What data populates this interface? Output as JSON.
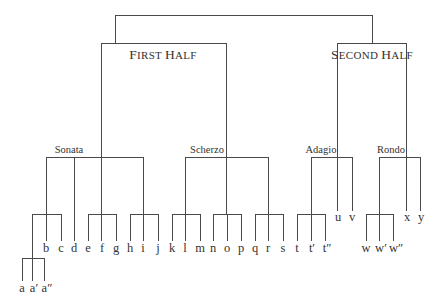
{
  "diagram": {
    "type": "tree",
    "root": {
      "children": [
        {
          "label": "First Half",
          "label_small_caps": true,
          "children": [
            {
              "label": "Sonata",
              "children": [
                {
                  "group": [
                    "a",
                    "a′",
                    "a″"
                  ],
                  "siblings": [
                    "b",
                    "c"
                  ]
                },
                "d",
                {
                  "group": [
                    "e",
                    "f",
                    "g"
                  ]
                },
                {
                  "group": [
                    "h",
                    "i",
                    "j"
                  ]
                }
              ]
            },
            {
              "label": "Scherzo",
              "children": [
                {
                  "group": [
                    "k",
                    "l",
                    "m"
                  ]
                },
                {
                  "group": [
                    "n",
                    "o",
                    "p"
                  ]
                },
                {
                  "group": [
                    "q",
                    "r",
                    "s"
                  ]
                }
              ]
            }
          ]
        },
        {
          "label": "Second Half",
          "label_small_caps": true,
          "children": [
            {
              "label": "Adagio",
              "children": [
                {
                  "group": [
                    "t",
                    "t′",
                    "t″"
                  ]
                },
                "u",
                "v"
              ]
            },
            {
              "label": "Rondo",
              "children": [
                {
                  "group": [
                    "w",
                    "w′",
                    "w″"
                  ]
                },
                "x",
                "y"
              ]
            }
          ]
        }
      ]
    }
  },
  "labels": {
    "first_half_big": "F",
    "first_half_rest": "IRST ",
    "first_half_big2": "H",
    "first_half_rest2": "ALF",
    "second_half_big": "S",
    "second_half_rest": "ECOND ",
    "second_half_big2": "H",
    "second_half_rest2": "ALF",
    "sonata": "Sonata",
    "scherzo": "Scherzo",
    "adagio": "Adagio",
    "rondo": "Rondo"
  },
  "leaves": {
    "a": "a",
    "a1": "a′",
    "a2": "a″",
    "b": "b",
    "c": "c",
    "d": "d",
    "e": "e",
    "f": "f",
    "g": "g",
    "h": "h",
    "i": "i",
    "j": "j",
    "k": "k",
    "l": "l",
    "m": "m",
    "n": "n",
    "o": "o",
    "p": "p",
    "q": "q",
    "r": "r",
    "s": "s",
    "t": "t",
    "t1": "t′",
    "t2": "t″",
    "u": "u",
    "v": "v",
    "w": "w",
    "w1": "w′",
    "w2": "w″",
    "x": "x",
    "y": "y"
  },
  "colors": {
    "line": "#4a4a4a",
    "text": "#333333",
    "background": "#ffffff"
  }
}
